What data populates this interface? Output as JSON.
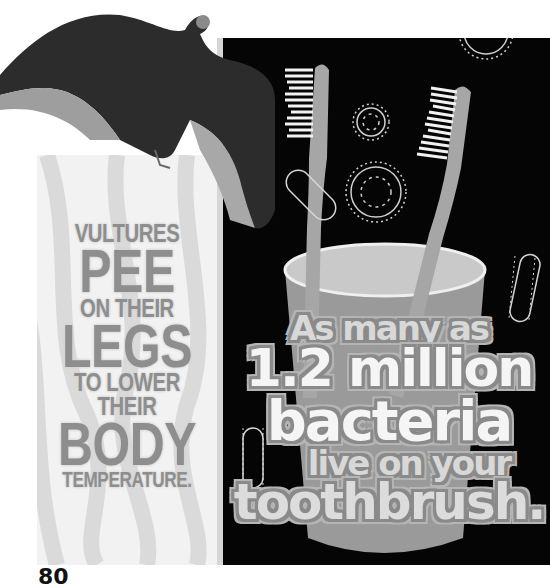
{
  "page": {
    "number": "80"
  },
  "left_fact": {
    "lines": [
      {
        "text": "VULTURES",
        "size": "small"
      },
      {
        "text": "PEE",
        "size": "large"
      },
      {
        "text": "ON THEIR",
        "size": "small"
      },
      {
        "text": "LEGS",
        "size": "large"
      },
      {
        "text": "TO LOWER",
        "size": "small"
      },
      {
        "text": "THEIR",
        "size": "small"
      },
      {
        "text": "BODY",
        "size": "large"
      },
      {
        "text": "TEMPERATURE.",
        "size": "xsmall"
      }
    ],
    "panel_color": "#f2f2f2",
    "text_color": "#8e8e8e",
    "image": "vulture-spread-wings"
  },
  "right_fact": {
    "lines": [
      {
        "text": "As many as"
      },
      {
        "text": "1.2 million"
      },
      {
        "text": "bacteria"
      },
      {
        "text": "live on your"
      },
      {
        "text": "toothbrush."
      }
    ],
    "panel_color": "#050505",
    "illustrations": [
      "toothbrush-left",
      "toothbrush-right",
      "cup",
      "bacteria-round",
      "bacteria-rod"
    ]
  }
}
